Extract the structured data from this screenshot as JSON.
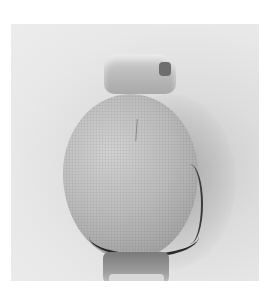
{
  "image": {
    "subject": "fabric-covered ball object with wrapped top and bottom ends",
    "style": "grayscale photograph on light background",
    "colors": {
      "page_background": "#ffffff",
      "photo_background": "#e8e8e8",
      "object_fabric": "#bcbcbc",
      "hem_stitching": "#2a2a2a",
      "shadow": "#a0a0a0"
    }
  }
}
